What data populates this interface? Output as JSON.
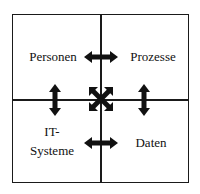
{
  "diagram": {
    "quadrants": [
      {
        "id": "top-left",
        "label": "Personen"
      },
      {
        "id": "top-right",
        "label": "Prozesse"
      },
      {
        "id": "bottom-left",
        "label_line1": "IT-",
        "label_line2": "Systeme"
      },
      {
        "id": "bottom-right",
        "label": "Daten"
      }
    ],
    "arrows": [
      {
        "id": "personen-prozesse",
        "type": "horizontal-double",
        "from": "Personen",
        "to": "Prozesse"
      },
      {
        "id": "personen-itsysteme",
        "type": "vertical-double",
        "from": "Personen",
        "to": "IT-Systeme"
      },
      {
        "id": "prozesse-daten",
        "type": "vertical-double",
        "from": "Prozesse",
        "to": "Daten"
      },
      {
        "id": "itsysteme-daten",
        "type": "horizontal-double",
        "from": "IT-Systeme",
        "to": "Daten"
      },
      {
        "id": "center-cross",
        "type": "four-way-diagonal"
      }
    ],
    "colors": {
      "line": "#1a1a1a",
      "arrow": "#111111",
      "text": "#111111",
      "background": "#ffffff"
    }
  }
}
